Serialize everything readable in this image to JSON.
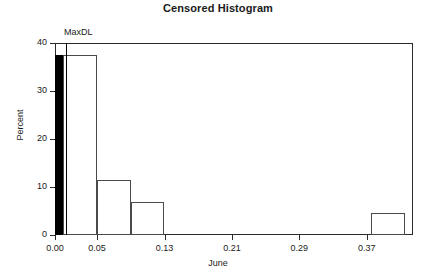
{
  "chart_data": {
    "type": "bar",
    "title": "Censored Histogram",
    "xlabel": "June",
    "ylabel": "Percent",
    "xlim": [
      0.0,
      0.425
    ],
    "ylim": [
      0,
      40
    ],
    "grid": false,
    "legend": null,
    "xticks": [
      "0.00",
      "0.05",
      "0.13",
      "0.21",
      "0.29",
      "0.37"
    ],
    "xtick_values": [
      0.0,
      0.05,
      0.13,
      0.21,
      0.29,
      0.37
    ],
    "yticks": [
      "0",
      "10",
      "20",
      "30",
      "40"
    ],
    "ytick_values": [
      0,
      10,
      20,
      30,
      40
    ],
    "bin_edges": [
      0.0,
      0.01,
      0.05,
      0.09,
      0.13,
      0.37,
      0.42
    ],
    "bars": [
      {
        "label": "0.00-0.01",
        "x0": 0.0,
        "x1": 0.01,
        "value": 37.5,
        "censored": true,
        "fill": "#000000"
      },
      {
        "label": "0.01-0.05",
        "x0": 0.01,
        "x1": 0.05,
        "value": 37.5,
        "censored": false,
        "fill": "#ffffff"
      },
      {
        "label": "0.05-0.09",
        "x0": 0.05,
        "x1": 0.09,
        "value": 11.5,
        "censored": false,
        "fill": "#ffffff"
      },
      {
        "label": "0.09-0.13",
        "x0": 0.09,
        "x1": 0.13,
        "value": 6.9,
        "censored": false,
        "fill": "#ffffff"
      },
      {
        "label": "0.37-0.42",
        "x0": 0.375,
        "x1": 0.415,
        "value": 4.6,
        "censored": false,
        "fill": "#ffffff"
      }
    ],
    "annotations": [
      {
        "name": "max-detection-limit",
        "label": "MaxDL",
        "x": 0.013
      }
    ]
  },
  "colors": {
    "axis": "#2b2b2b",
    "bar_outline": "#4a4a4a",
    "censored_fill": "#000000",
    "text": "#1a1a1a",
    "background": "#ffffff"
  }
}
